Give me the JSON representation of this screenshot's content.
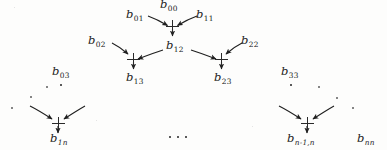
{
  "figure": {
    "kind": "dataflow-diagram",
    "background_color": "#fdfdfc",
    "ink_color": "#1b1b1b",
    "width": 387,
    "height": 150
  },
  "labels": {
    "b00": {
      "base": "b",
      "sub": "00",
      "text": "b00"
    },
    "b01": {
      "base": "b",
      "sub": "01",
      "text": "b01"
    },
    "b11": {
      "base": "b",
      "sub": "11",
      "text": "b11"
    },
    "b02": {
      "base": "b",
      "sub": "02",
      "text": "b02"
    },
    "b12": {
      "base": "b",
      "sub": "12",
      "text": "b12"
    },
    "b22": {
      "base": "b",
      "sub": "22",
      "text": "b22"
    },
    "b13": {
      "base": "b",
      "sub": "13",
      "text": "b13"
    },
    "b23": {
      "base": "b",
      "sub": "23",
      "text": "b23"
    },
    "b03": {
      "base": "b",
      "sub": "03",
      "text": "b03"
    },
    "b33": {
      "base": "b",
      "sub": "33",
      "text": "b33"
    },
    "b1n": {
      "base": "b",
      "sub": "1n",
      "text": "b1n"
    },
    "bn1n": {
      "base": "b",
      "sub": "n-1,n",
      "text": "bn-1,n"
    },
    "bnn": {
      "base": "b",
      "sub": "nn",
      "text": "bnn"
    }
  },
  "nodes": [
    {
      "id": "node-root",
      "glyph": "plus",
      "output_label": "b12",
      "inputs": [
        "b01",
        "b11"
      ]
    },
    {
      "id": "node-left",
      "glyph": "plus",
      "output_label": "b13",
      "inputs": [
        "b02",
        "b12"
      ]
    },
    {
      "id": "node-right",
      "glyph": "plus",
      "output_label": "b23",
      "inputs": [
        "b12",
        "b22"
      ]
    },
    {
      "id": "node-far-left",
      "glyph": "plus",
      "output_label": "b1n",
      "inputs": [
        "unlabeled-left",
        "unlabeled-right"
      ]
    },
    {
      "id": "node-far-right",
      "glyph": "plus",
      "output_label": "bn-1,n",
      "inputs": [
        "unlabeled-left",
        "unlabeled-right"
      ]
    }
  ],
  "ellipses": {
    "bottom_center": "...",
    "vertical_left": "vertical-dots",
    "vertical_right": "vertical-dots",
    "diagonal_left": "diagonal-dots",
    "diagonal_right": "diagonal-dots"
  }
}
